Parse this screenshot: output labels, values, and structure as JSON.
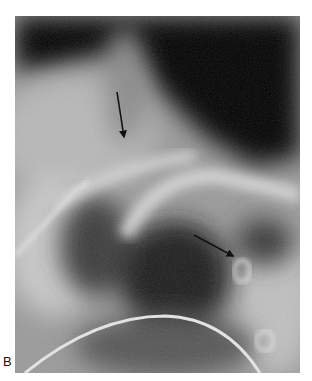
{
  "figure": {
    "panel_label": "B",
    "arrows": [
      {
        "name": "upper-arrow",
        "x1": 102,
        "y1": 76,
        "x2": 109,
        "y2": 121
      },
      {
        "name": "lower-arrow",
        "x1": 179,
        "y1": 219,
        "x2": 218,
        "y2": 240
      }
    ],
    "colors": {
      "background": "#ffffff",
      "dark_region": "#060606",
      "mid_gray": "#8a8a8a",
      "light_gray": "#d8d8d8",
      "arrow": "#111111"
    }
  }
}
